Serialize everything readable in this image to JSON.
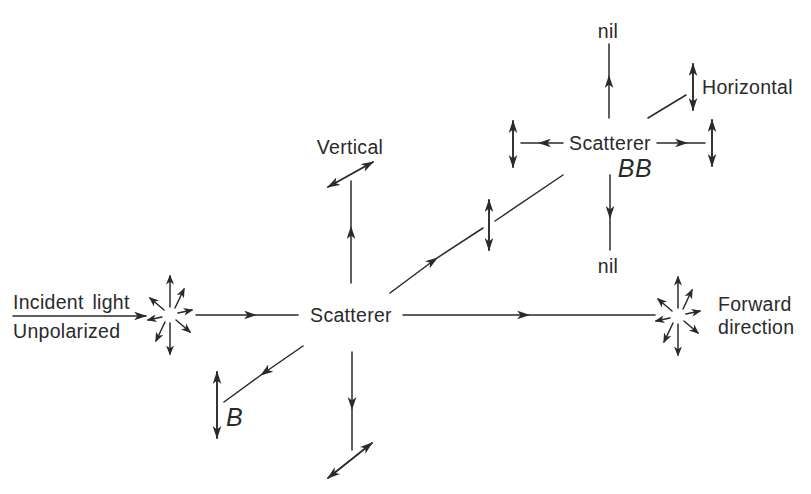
{
  "page": {
    "background": "#ffffff",
    "ink": "#2a2a2a"
  },
  "diagram": {
    "incident": {
      "line1": "Incident light",
      "line2": "Unpolarized"
    },
    "main_scatterer": {
      "label": "Scatterer"
    },
    "labels": {
      "vertical": "Vertical",
      "b": "B",
      "forward_line1": "Forward",
      "forward_line2": "direction"
    },
    "second_scatterer": {
      "label": "Scatterer",
      "sublabel": "BB",
      "nil_top": "nil",
      "nil_bottom": "nil",
      "horizontal": "Horizontal"
    },
    "icons": {
      "unpolarized_starburst": "radial-arrows",
      "forward_starburst": "radial-arrows"
    }
  }
}
